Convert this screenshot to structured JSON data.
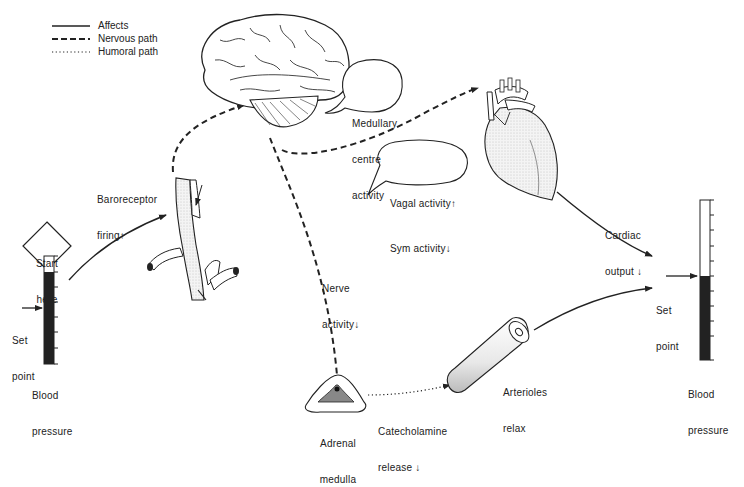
{
  "legend": {
    "items": [
      {
        "style": "solid",
        "label": "Affects"
      },
      {
        "style": "dashed",
        "label": "Nervous path"
      },
      {
        "style": "dotted",
        "label": "Humoral path"
      }
    ]
  },
  "start": {
    "label_line1": "Start",
    "label_line2": "here"
  },
  "left_gauge": {
    "set_point_line1": "Set",
    "set_point_line2": "point",
    "caption_line1": "Blood",
    "caption_line2": "pressure",
    "fill_level": "high"
  },
  "right_gauge": {
    "set_point_line1": "Set",
    "set_point_line2": "point",
    "caption_line1": "Blood",
    "caption_line2": "pressure",
    "fill_level": "set point"
  },
  "labels": {
    "baroreceptor_line1": "Baroreceptor",
    "baroreceptor_line2": "firing↑",
    "medullary_line1": "Medullary",
    "medullary_line2": "centre",
    "medullary_line3": "activity",
    "vagal": "Vagal activity↑",
    "sym": "Sym activity↓",
    "cardiac_line1": "Cardiac",
    "cardiac_line2": "output ↓",
    "nerve_line1": "Nerve",
    "nerve_line2": "activity↓",
    "adrenal_line1": "Adrenal",
    "adrenal_line2": "medulla",
    "catechol_line1": "Catecholamine",
    "catechol_line2": "release ↓",
    "arterioles_line1": "Arterioles",
    "arterioles_line2": "relax"
  },
  "figures": {
    "brain": "brain-illustration",
    "heart": "heart-illustration",
    "carotid": "carotid-artery-illustration",
    "adrenal": "adrenal-gland-illustration",
    "arteriole": "arteriole-tube-illustration"
  }
}
